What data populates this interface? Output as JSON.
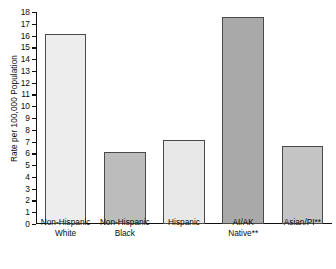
{
  "chart_data": {
    "type": "bar",
    "title": "",
    "subtitle": "",
    "xlabel": "",
    "ylabel": "Rate per 100,000 Population",
    "ylim": [
      0,
      18
    ],
    "ytick_step": 1,
    "grid": false,
    "legend": "none",
    "categories": [
      "Non-Hispanic White",
      "Non-Hispanic Black",
      "Hispanic",
      "AI/AK Native**",
      "Asian/PI**"
    ],
    "category_lines": [
      [
        "Non-Hispanic",
        "White"
      ],
      [
        "Non-Hispanic",
        "Black"
      ],
      [
        "Hispanic",
        ""
      ],
      [
        "AI/AK",
        "Native**"
      ],
      [
        "Asian/PI**",
        ""
      ]
    ],
    "values": [
      16.1,
      6.1,
      7.1,
      17.6,
      6.6
    ],
    "bar_colors": [
      "#ededed",
      "#bcbcbc",
      "#e8e8e8",
      "#a9a9a9",
      "#c4c4c4"
    ],
    "bar_border_color": "#4a4a4a",
    "ytick_labels": [
      "0",
      "1",
      "2",
      "3",
      "4",
      "5",
      "6",
      "7",
      "8",
      "9",
      "10",
      "11",
      "12",
      "13",
      "14",
      "15",
      "16",
      "17",
      "18"
    ],
    "annotations": [
      "**"
    ],
    "axis_color": "#101010"
  }
}
